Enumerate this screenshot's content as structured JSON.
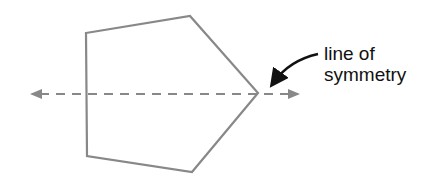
{
  "diagram": {
    "label_lines": [
      "line of",
      "symmetry"
    ],
    "shape": {
      "type": "pentagon",
      "vertices": [
        [
          86,
          33
        ],
        [
          190,
          16
        ],
        [
          258,
          93
        ],
        [
          192,
          172
        ],
        [
          87,
          156
        ]
      ],
      "stroke": "#888888"
    },
    "symmetry_line": {
      "y": 94,
      "x_start": 30,
      "x_end": 300,
      "style": "dashed",
      "arrows": "both",
      "color": "#888888"
    },
    "pointer_arrow": {
      "color": "#111111"
    }
  }
}
